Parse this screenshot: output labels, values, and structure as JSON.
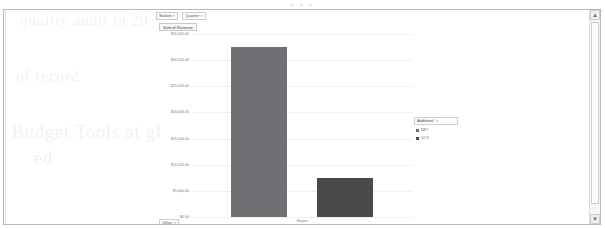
{
  "page": {
    "ghost_top_text": "• • •",
    "ghost_lines": [
      "quality audit in 20",
      "of record",
      "Budget Tools at gl",
      "ed"
    ]
  },
  "filters": {
    "items": [
      {
        "label": "Station",
        "caret": "▾"
      },
      {
        "label": "Quarter",
        "caret": "▾"
      }
    ],
    "separator": "|"
  },
  "measure": {
    "label": "Sum of Revenue"
  },
  "legend": {
    "title": "Additional",
    "caret": "▾",
    "items": [
      {
        "label": "NET",
        "color": "#6f7073"
      },
      {
        "label": "GCS",
        "color": "#4a4a4d"
      }
    ]
  },
  "bottom_control": {
    "label": "Other",
    "caret": "▾"
  },
  "scrollbar": {
    "up_arrow": "▲",
    "down_arrow": "▼"
  },
  "chart_data": {
    "type": "bar",
    "title": "Sum of Revenue",
    "xlabel": "Station",
    "ylabel": "",
    "categories": [
      "NET",
      "GCS"
    ],
    "values": [
      32500,
      7500
    ],
    "colors": [
      "#6f7073",
      "#4a4a4d"
    ],
    "ylim": [
      0,
      35000
    ],
    "ytick_labels": [
      "$35,000.00",
      "$30,000.00",
      "$25,000.00",
      "$20,000.00",
      "$15,000.00",
      "$10,000.00",
      "$5,000.00",
      "$0.00"
    ],
    "ytick_values": [
      35000,
      30000,
      25000,
      20000,
      15000,
      10000,
      5000,
      0
    ],
    "grid": true,
    "legend_position": "right"
  }
}
